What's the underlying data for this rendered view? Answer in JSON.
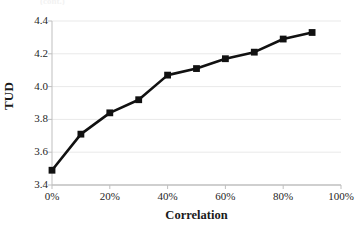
{
  "chart_data": {
    "type": "line",
    "title": "",
    "xlabel": "Correlation",
    "ylabel": "TUD",
    "x": [
      0,
      10,
      20,
      30,
      40,
      50,
      60,
      70,
      80,
      90
    ],
    "x_tick_labels": [
      "0%",
      "20%",
      "40%",
      "60%",
      "80%",
      "100%"
    ],
    "x_tick_values": [
      0,
      20,
      40,
      60,
      80,
      100
    ],
    "y_tick_labels": [
      "3.4",
      "3.6",
      "3.8",
      "4.0",
      "4.2",
      "4.4"
    ],
    "y_tick_values": [
      3.4,
      3.6,
      3.8,
      4.0,
      4.2,
      4.4
    ],
    "xlim": [
      0,
      100
    ],
    "ylim": [
      3.4,
      4.4
    ],
    "grid": "horizontal",
    "legend": "none",
    "series": [
      {
        "name": "TUD vs Correlation",
        "marker": "square",
        "marker_color": "#111111",
        "line_color": "#111111",
        "values": [
          3.49,
          3.71,
          3.84,
          3.92,
          4.07,
          4.11,
          4.17,
          4.21,
          4.29,
          4.33
        ]
      }
    ]
  },
  "axes": {
    "y_title": "TUD",
    "x_title": "Correlation"
  },
  "cut_off_header": {
    "text": "(cont.)"
  },
  "colors": {
    "plot_background": "#ffffff",
    "grid": "#e9e9e9",
    "axis": "#bfbfbf",
    "series": "#111111",
    "text": "#262626"
  }
}
